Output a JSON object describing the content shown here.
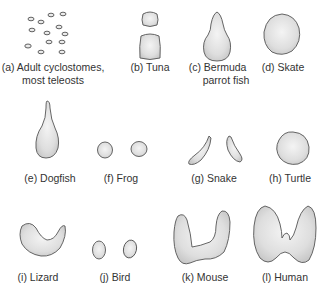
{
  "figure": {
    "panels": [
      {
        "id": "a",
        "label_line1": "(a) Adult cyclostomes,",
        "label_line2": "most teleosts",
        "shape": "scattered-follicles"
      },
      {
        "id": "b",
        "label_line1": "(b) Tuna",
        "shape": "two-lobes-stacked"
      },
      {
        "id": "c",
        "label_line1": "(c) Bermuda",
        "label_line2": "parrot fish",
        "shape": "pear"
      },
      {
        "id": "d",
        "label_line1": "(d) Skate",
        "shape": "round"
      },
      {
        "id": "e",
        "label_line1": "(e) Dogfish",
        "shape": "teardrop"
      },
      {
        "id": "f",
        "label_line1": "(f) Frog",
        "shape": "paired-oval"
      },
      {
        "id": "g",
        "label_line1": "(g) Snake",
        "shape": "paired-comma"
      },
      {
        "id": "h",
        "label_line1": "(h) Turtle",
        "shape": "round"
      },
      {
        "id": "i",
        "label_line1": "(i) Lizard",
        "shape": "crescent"
      },
      {
        "id": "j",
        "label_line1": "(j) Bird",
        "shape": "paired-oval"
      },
      {
        "id": "k",
        "label_line1": "(k) Mouse",
        "shape": "u-shape"
      },
      {
        "id": "l",
        "label_line1": "(l) Human",
        "shape": "butterfly-with-isthmus"
      }
    ],
    "colors": {
      "outline": "#555555",
      "fill": "#e4e4e4",
      "text": "#333333",
      "background": "#ffffff"
    }
  }
}
